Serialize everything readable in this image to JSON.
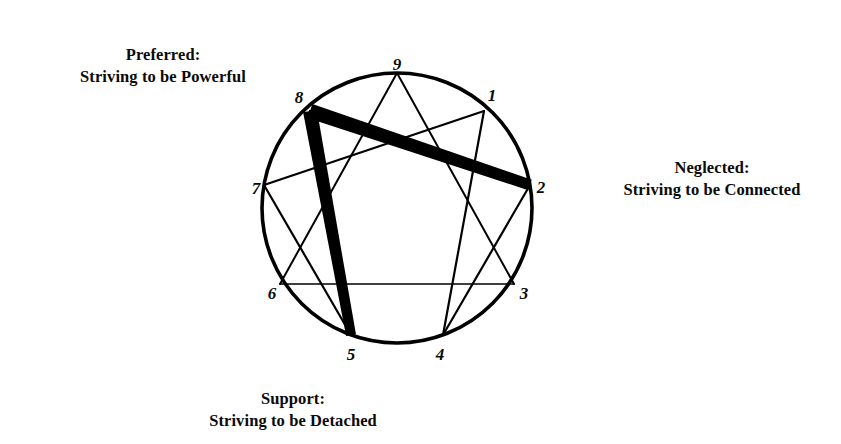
{
  "diagram": {
    "type": "enneagram",
    "circle": {
      "cx": 397,
      "cy": 208,
      "r": 135,
      "stroke": "#000000",
      "stroke_width": 3.6
    },
    "ink_color": "#000000",
    "background": "#ffffff",
    "points": [
      {
        "number": "9",
        "angle_deg": 270,
        "x": 397,
        "y": 73,
        "label_x": 397,
        "label_y": 66
      },
      {
        "number": "1",
        "angle_deg": 310,
        "x": 484,
        "y": 111,
        "label_x": 492,
        "label_y": 97
      },
      {
        "number": "2",
        "angle_deg": 350,
        "x": 530,
        "y": 185,
        "label_x": 541,
        "label_y": 189
      },
      {
        "number": "3",
        "angle_deg": 30,
        "x": 514,
        "y": 284,
        "label_x": 524,
        "label_y": 295
      },
      {
        "number": "4",
        "angle_deg": 70,
        "x": 443,
        "y": 335,
        "label_x": 440,
        "label_y": 356
      },
      {
        "number": "5",
        "angle_deg": 110,
        "x": 351,
        "y": 335,
        "label_x": 351,
        "label_y": 356
      },
      {
        "number": "6",
        "angle_deg": 150,
        "x": 280,
        "y": 284,
        "label_x": 272,
        "label_y": 295
      },
      {
        "number": "7",
        "angle_deg": 190,
        "x": 264,
        "y": 185,
        "label_x": 256,
        "label_y": 190
      },
      {
        "number": "8",
        "angle_deg": 230,
        "x": 310,
        "y": 111,
        "label_x": 299,
        "label_y": 99
      }
    ],
    "inner_lines": [
      {
        "name": "triangle-9-3",
        "from": "9",
        "to": "3",
        "width": 2.0
      },
      {
        "name": "triangle-3-6",
        "from": "3",
        "to": "6",
        "width": 1.6
      },
      {
        "name": "triangle-6-9",
        "from": "6",
        "to": "9",
        "width": 2.0
      },
      {
        "name": "hexad-1-4",
        "from": "1",
        "to": "4",
        "width": 2.2
      },
      {
        "name": "hexad-4-2",
        "from": "4",
        "to": "2",
        "width": 2.2
      },
      {
        "name": "hexad-2-8",
        "from": "2",
        "to": "8",
        "width": 2.2
      },
      {
        "name": "hexad-8-5",
        "from": "8",
        "to": "5",
        "width": 2.2
      },
      {
        "name": "hexad-5-7",
        "from": "5",
        "to": "7",
        "width": 2.2
      },
      {
        "name": "hexad-7-1",
        "from": "7",
        "to": "1",
        "width": 2.2
      }
    ],
    "emphasized_lines": [
      {
        "name": "emphasis-8-2",
        "from": "8",
        "to": "2",
        "width_start": 15,
        "width_end": 11,
        "color": "#000000"
      },
      {
        "name": "emphasis-8-5",
        "from": "8",
        "to": "5",
        "width_start": 14,
        "width_end": 10,
        "color": "#000000"
      }
    ]
  },
  "captions": {
    "preferred": {
      "line1": "Preferred:",
      "line2": "Striving to be Powerful"
    },
    "neglected": {
      "line1": "Neglected:",
      "line2": "Striving to be Connected"
    },
    "support": {
      "line1": "Support:",
      "line2": "Striving to be Detached"
    }
  }
}
